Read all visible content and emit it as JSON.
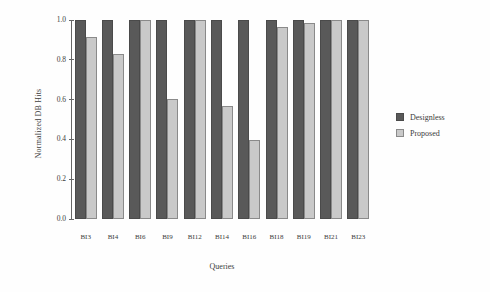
{
  "chart_data": {
    "type": "bar",
    "title": "",
    "xlabel": "Queries",
    "ylabel": "Normalized DB Hits",
    "ylim": [
      0.0,
      1.0
    ],
    "yticks": [
      "0.0",
      "0.2",
      "0.4",
      "0.6",
      "0.8",
      "1.0"
    ],
    "ytick_values": [
      0.0,
      0.2,
      0.4,
      0.6,
      0.8,
      1.0
    ],
    "grid": false,
    "legend_position": "right",
    "categories": [
      "BI3",
      "BI4",
      "BI6",
      "BI9",
      "BI12",
      "BI14",
      "BI16",
      "BI18",
      "BI19",
      "BI21",
      "BI23"
    ],
    "series": [
      {
        "name": "Designless",
        "color": "#595959",
        "values": [
          1.0,
          1.0,
          1.0,
          1.0,
          1.0,
          1.0,
          1.0,
          1.0,
          1.0,
          1.0,
          1.0
        ]
      },
      {
        "name": "Proposed",
        "color": "#c9c9c9",
        "values": [
          0.915,
          0.83,
          1.0,
          0.605,
          1.0,
          0.57,
          0.395,
          0.965,
          0.985,
          1.0,
          1.0
        ]
      }
    ]
  }
}
